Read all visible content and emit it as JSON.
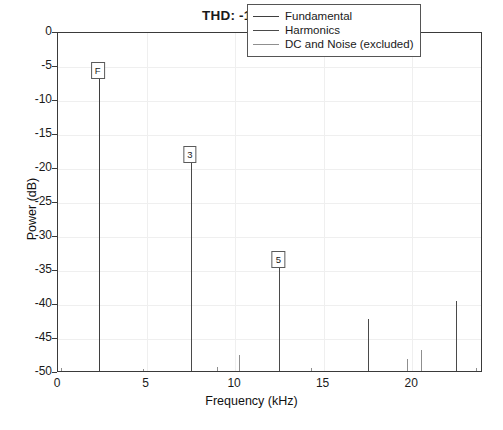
{
  "chart_data": {
    "type": "bar",
    "title": "THD: -12.71 dB",
    "xlabel": "Frequency (kHz)",
    "ylabel": "Power (dB)",
    "xlim": [
      0,
      24
    ],
    "ylim": [
      -50,
      0
    ],
    "xticks": [
      0,
      5,
      10,
      15,
      20
    ],
    "xtick_labels": [
      "0",
      "5",
      "10",
      "15",
      "20"
    ],
    "xticks_minor_step": 0.8333,
    "yticks": [
      0,
      -5,
      -10,
      -15,
      -20,
      -25,
      -30,
      -35,
      -40,
      -45,
      -50
    ],
    "ytick_labels": [
      "0",
      "-5",
      "-10",
      "-15",
      "-20",
      "-25",
      "-30",
      "-35",
      "-40",
      "-45",
      "-50"
    ],
    "grid": true,
    "legend_position": "upper right",
    "legend": [
      {
        "name": "Fundamental",
        "color": "#3f3f3f"
      },
      {
        "name": "Harmonics",
        "color": "#4a4a4a"
      },
      {
        "name": "DC and Noise (excluded)",
        "color": "#8f8f8f"
      }
    ],
    "series": [
      {
        "name": "Fundamental",
        "kind": "fundamental",
        "points": [
          {
            "x": 2.3,
            "y": -6.9,
            "label": "F"
          }
        ]
      },
      {
        "name": "Harmonics",
        "kind": "harmonic",
        "points": [
          {
            "x": 7.5,
            "y": -19.3,
            "label": "3"
          },
          {
            "x": 12.5,
            "y": -34.7,
            "label": "5"
          },
          {
            "x": 17.5,
            "y": -42.4,
            "label": ""
          },
          {
            "x": 22.45,
            "y": -39.7,
            "label": ""
          }
        ]
      },
      {
        "name": "DC and Noise (excluded)",
        "kind": "noise",
        "points": [
          {
            "x": 10.2,
            "y": -47.6,
            "label": ""
          },
          {
            "x": 9.0,
            "y": -49.4,
            "label": ""
          },
          {
            "x": 14.3,
            "y": -49.5,
            "label": ""
          },
          {
            "x": 19.7,
            "y": -48.3,
            "label": ""
          },
          {
            "x": 20.5,
            "y": -46.9,
            "label": ""
          },
          {
            "x": 0.15,
            "y": -49.6,
            "label": ""
          },
          {
            "x": 4.8,
            "y": -49.7,
            "label": ""
          },
          {
            "x": 23.6,
            "y": -49.6,
            "label": ""
          }
        ]
      }
    ],
    "annotations": [
      {
        "text": "F",
        "x": 2.3,
        "y": -6.9
      },
      {
        "text": "3",
        "x": 7.5,
        "y": -19.3
      },
      {
        "text": "5",
        "x": 12.5,
        "y": -34.7
      }
    ]
  }
}
